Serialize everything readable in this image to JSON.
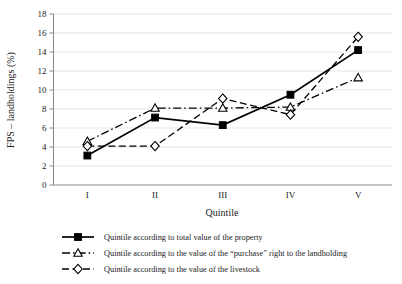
{
  "chart_data": {
    "type": "line",
    "title": "",
    "xlabel": "Quintile",
    "ylabel": "FPS – landholdings (%)",
    "categories": [
      "I",
      "II",
      "III",
      "IV",
      "V"
    ],
    "ylim": [
      0,
      18
    ],
    "ytick_step": 2,
    "yticks": [
      "0",
      "2",
      "4",
      "6",
      "8",
      "10",
      "12",
      "14",
      "16",
      "18"
    ],
    "grid": "horizontal",
    "legend_position": "bottom",
    "series": [
      {
        "name": "Quintile according to total value of the property",
        "marker": "filled-square",
        "line_style": "solid",
        "color": "#000000",
        "values": [
          3.1,
          7.1,
          6.3,
          9.5,
          14.2
        ]
      },
      {
        "name": "Quintile according to the value of the “purchase” right to the landholding",
        "marker": "open-triangle",
        "line_style": "dash-dot",
        "color": "#000000",
        "values": [
          4.6,
          8.1,
          8.1,
          8.2,
          11.3
        ]
      },
      {
        "name": "Quintile according to the value of the livestock",
        "marker": "open-diamond",
        "line_style": "dashed",
        "color": "#000000",
        "values": [
          4.1,
          4.1,
          9.1,
          7.4,
          15.6
        ]
      }
    ]
  },
  "axis": {
    "y_title": "FPS – landholdings (%)",
    "x_title": "Quintile"
  },
  "legend": {
    "items": [
      {
        "label": "Quintile according to total value of the property"
      },
      {
        "label": "Quintile according to the value of the “purchase” right to the landholding"
      },
      {
        "label": "Quintile according to the value of the livestock"
      }
    ]
  }
}
